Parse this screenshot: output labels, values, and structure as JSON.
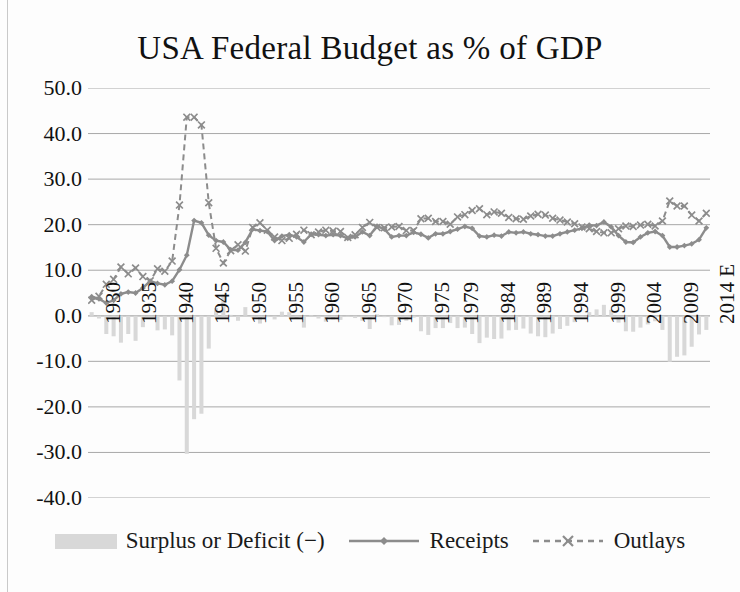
{
  "chart_data": {
    "type": "line",
    "title": "USA Federal Budget as % of GDP",
    "xlabel": "",
    "ylabel": "",
    "ylim": [
      -40.0,
      50.0
    ],
    "ytick_step": 10.0,
    "ytick_labels": [
      "50.0",
      "40.0",
      "30.0",
      "20.0",
      "10.0",
      "0.0",
      "-10.0",
      "-20.0",
      "-30.0",
      "-40.0"
    ],
    "ytick_values": [
      50.0,
      40.0,
      30.0,
      20.0,
      10.0,
      0.0,
      -10.0,
      -20.0,
      -30.0,
      -40.0
    ],
    "grid": true,
    "grid_axis": "y",
    "legend_position": "bottom",
    "x_tick_labels": [
      "1930",
      "1935",
      "1940",
      "1945",
      "1950",
      "1955",
      "1960",
      "1965",
      "1970",
      "1975",
      "1979",
      "1984",
      "1989",
      "1994",
      "1999",
      "2004",
      "2009",
      "2014 E"
    ],
    "x_tick_years": [
      1930,
      1935,
      1940,
      1945,
      1950,
      1955,
      1960,
      1965,
      1970,
      1975,
      1979,
      1984,
      1989,
      1994,
      1999,
      2004,
      2009,
      2014
    ],
    "x": [
      1930,
      1931,
      1932,
      1933,
      1934,
      1935,
      1936,
      1937,
      1938,
      1939,
      1940,
      1941,
      1942,
      1943,
      1944,
      1945,
      1946,
      1947,
      1948,
      1949,
      1950,
      1951,
      1952,
      1953,
      1954,
      1955,
      1956,
      1957,
      1958,
      1959,
      1960,
      1961,
      1962,
      1963,
      1964,
      1965,
      1966,
      1967,
      1968,
      1969,
      1970,
      1971,
      1972,
      1973,
      1974,
      1975,
      1976,
      1977,
      1978,
      1979,
      1980,
      1981,
      1982,
      1983,
      1984,
      1985,
      1986,
      1987,
      1988,
      1989,
      1990,
      1991,
      1992,
      1993,
      1994,
      1995,
      1996,
      1997,
      1998,
      1999,
      2000,
      2001,
      2002,
      2003,
      2004,
      2005,
      2006,
      2007,
      2008,
      2009,
      2010,
      2011,
      2012,
      2013,
      2014
    ],
    "series": [
      {
        "name": "Receipts",
        "style": "solid-line-diamond-markers",
        "color": "#8c8c8c",
        "values": [
          4.2,
          3.7,
          2.8,
          3.4,
          4.8,
          5.2,
          5.0,
          6.1,
          7.6,
          7.1,
          6.8,
          7.6,
          10.1,
          13.3,
          20.9,
          20.4,
          17.7,
          16.5,
          16.2,
          14.5,
          14.4,
          16.1,
          19.0,
          18.7,
          18.5,
          16.5,
          17.5,
          17.8,
          17.3,
          16.2,
          17.9,
          17.8,
          17.6,
          17.8,
          17.6,
          17.0,
          17.3,
          18.4,
          17.6,
          19.7,
          19.0,
          17.3,
          17.6,
          17.6,
          18.3,
          17.9,
          17.1,
          18.0,
          18.0,
          18.5,
          19.0,
          19.6,
          19.2,
          17.5,
          17.3,
          17.7,
          17.5,
          18.4,
          18.2,
          18.4,
          18.0,
          17.8,
          17.5,
          17.5,
          18.0,
          18.4,
          18.8,
          19.2,
          19.9,
          19.8,
          20.6,
          19.5,
          17.6,
          16.2,
          16.1,
          17.3,
          18.2,
          18.5,
          17.6,
          15.1,
          15.1,
          15.4,
          15.8,
          16.7,
          19.3
        ]
      },
      {
        "name": "Outlays",
        "style": "dashed-line-x-markers",
        "color": "#8c8c8c",
        "values": [
          3.4,
          4.3,
          6.9,
          8.0,
          10.7,
          9.2,
          10.5,
          8.6,
          7.7,
          10.3,
          9.8,
          12.0,
          24.3,
          43.6,
          43.6,
          41.9,
          24.8,
          14.8,
          11.6,
          14.3,
          15.6,
          14.2,
          19.4,
          20.4,
          18.8,
          17.3,
          16.5,
          17.0,
          17.9,
          18.8,
          17.8,
          18.4,
          18.8,
          18.6,
          18.5,
          17.2,
          17.8,
          19.4,
          20.5,
          19.4,
          19.3,
          19.5,
          19.6,
          18.7,
          18.7,
          21.3,
          21.4,
          20.7,
          20.7,
          20.1,
          21.7,
          22.2,
          23.1,
          23.5,
          22.2,
          22.8,
          22.5,
          21.6,
          21.3,
          21.2,
          21.9,
          22.3,
          22.1,
          21.4,
          21.0,
          20.6,
          20.2,
          19.5,
          19.1,
          18.5,
          18.2,
          18.2,
          19.1,
          19.7,
          19.6,
          19.9,
          20.1,
          19.7,
          20.8,
          25.2,
          24.1,
          24.1,
          22.1,
          20.8,
          22.5
        ]
      },
      {
        "name": "Surplus or Deficit (−)",
        "style": "bars",
        "color": "#d8d8d8",
        "values": [
          0.8,
          -0.6,
          -4.0,
          -4.5,
          -5.9,
          -4.0,
          -5.5,
          -2.5,
          -0.1,
          -3.2,
          -3.0,
          -4.3,
          -14.2,
          -30.3,
          -22.7,
          -21.5,
          -7.2,
          1.7,
          4.6,
          0.2,
          -1.1,
          1.9,
          -0.4,
          -1.7,
          -0.3,
          -0.8,
          0.9,
          0.8,
          -0.6,
          -2.6,
          0.1,
          -0.6,
          -1.3,
          -0.8,
          -0.9,
          -0.2,
          -0.5,
          -1.1,
          -2.9,
          0.3,
          -0.3,
          -2.1,
          -2.0,
          -1.1,
          -0.4,
          -3.4,
          -4.2,
          -2.7,
          -2.7,
          -1.6,
          -2.7,
          -2.6,
          -4.0,
          -6.0,
          -4.8,
          -5.1,
          -5.0,
          -3.2,
          -3.1,
          -2.8,
          -3.9,
          -4.5,
          -4.7,
          -3.9,
          -2.9,
          -2.2,
          -1.4,
          -0.3,
          0.8,
          1.4,
          2.4,
          1.3,
          -1.5,
          -3.4,
          -3.5,
          -2.6,
          -1.9,
          -1.2,
          -3.1,
          -10.1,
          -9.0,
          -8.7,
          -6.8,
          -4.1,
          -3.1
        ]
      }
    ]
  },
  "legend": {
    "items": [
      {
        "label": "Surplus or Deficit (−)",
        "marker": "bar-swatch"
      },
      {
        "label": "Receipts",
        "marker": "line-diamond"
      },
      {
        "label": "Outlays",
        "marker": "dashed-x"
      }
    ]
  },
  "colors": {
    "series_line": "#8c8c8c",
    "bar_fill": "#d8d8d8",
    "gridline": "#a8a8a8",
    "text": "#111111",
    "background": "#fdfdfd"
  }
}
